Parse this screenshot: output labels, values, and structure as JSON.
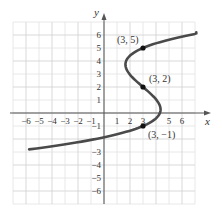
{
  "chart_data": {
    "type": "line",
    "title": "",
    "xlabel": "x",
    "ylabel": "y",
    "xlim": [
      -7,
      7
    ],
    "ylim": [
      -7,
      7
    ],
    "grid": true,
    "x_ticks": [
      "-6",
      "-5",
      "-4",
      "-3",
      "-2",
      "-1",
      "1",
      "2",
      "3",
      "5",
      "6"
    ],
    "x_tick_values": [
      -6,
      -5,
      -4,
      -3,
      -2,
      -1,
      1,
      2,
      3,
      5,
      6
    ],
    "y_ticks": [
      "6",
      "5",
      "4",
      "3",
      "2",
      "1",
      "-1",
      "-3",
      "-4",
      "-5",
      "-6"
    ],
    "y_tick_values": [
      6,
      5,
      4,
      3,
      2,
      1,
      -1,
      -3,
      -4,
      -5,
      -6
    ],
    "series": [
      {
        "name": "curve",
        "description": "x as cubic function of y passing through (3,5), (3,2), (3,-1)",
        "color": "#4a4a4a",
        "y_range": [
          -2.8,
          6.2
        ],
        "coefficient": 0.13,
        "center_x": 3,
        "roots_y": [
          5,
          2,
          -1
        ]
      }
    ],
    "points": [
      {
        "x": 3,
        "y": 5,
        "label": "(3, 5)"
      },
      {
        "x": 3,
        "y": 2,
        "label": "(3, 2)"
      },
      {
        "x": 3,
        "y": -1,
        "label": "(3, −1)"
      }
    ]
  },
  "colors": {
    "grid_minor": "#e2e2e2",
    "grid_major": "#cfcfcf",
    "axis": "#555555",
    "curve": "#4a4a4a",
    "point": "#111111"
  }
}
